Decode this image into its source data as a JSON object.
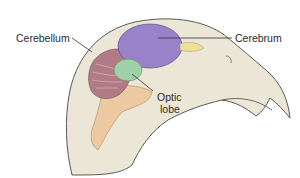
{
  "diagram": {
    "labels": {
      "cerebellum": "Cerebellum",
      "cerebrum": "Cerebrum",
      "optic_lobe_line1": "Optic",
      "optic_lobe_line2": "lobe"
    },
    "colors": {
      "head": "#ece6d6",
      "head_outline": "#5a5a55",
      "cerebrum": "#9a82c8",
      "cerebellum": "#b07a86",
      "optic_lobe": "#9fd0a8",
      "brainstem": "#ecc9a0",
      "olfactory_bulb": "#eedf9a"
    }
  }
}
